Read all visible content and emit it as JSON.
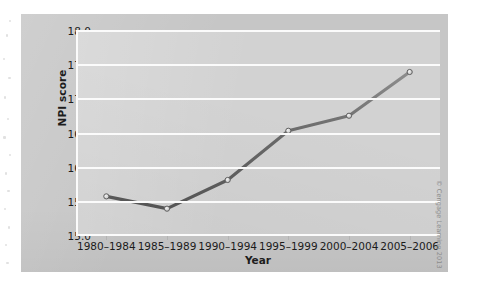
{
  "chart_data": {
    "type": "line",
    "title": "",
    "xlabel": "Year",
    "ylabel": "NPI score",
    "categories": [
      "1980–1984",
      "1985–1989",
      "1990–1994",
      "1995–1999",
      "2000–2004",
      "2005–2006"
    ],
    "values": [
      15.58,
      15.4,
      15.82,
      16.54,
      16.76,
      17.4
    ],
    "series": [
      {
        "name": "NPI score",
        "values": [
          15.58,
          15.4,
          15.82,
          16.54,
          16.76,
          17.4
        ]
      }
    ],
    "ylim": [
      15.0,
      18.0
    ],
    "yticks": [
      "15.0",
      "15.5",
      "16.0",
      "16.5",
      "17.0",
      "17.5",
      "18.0"
    ],
    "ytick_values": [
      15.0,
      15.5,
      16.0,
      16.5,
      17.0,
      17.5,
      18.0
    ],
    "grid": true,
    "legend": false,
    "legend_position": "none",
    "line_color": "#6a6a6a",
    "marker_color": "#d8d8d8",
    "marker_edge_color": "#5e5e5e",
    "plot_background": "#d2d2d2",
    "panel_background": "#c6c6c6",
    "gridline_color": "#fbfbfb"
  },
  "figure": {
    "copyright": "© Cengage Learning 2013"
  }
}
